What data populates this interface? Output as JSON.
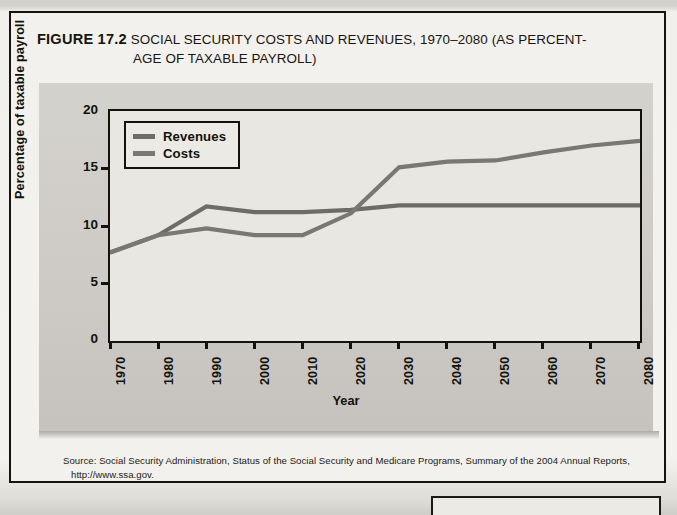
{
  "figure": {
    "number_label": "FIGURE 17.2",
    "title_line1": "SOCIAL SECURITY COSTS AND REVENUES, 1970–2080 (AS PERCENT-",
    "title_line2": "AGE OF TAXABLE PAYROLL)"
  },
  "source": {
    "line1": "Source: Social Security Administration, Status of the Social Security and Medicare Programs, Summary of the 2004 Annual Reports,",
    "line2": "http://www.ssa.gov.",
    "label": "Source:"
  },
  "chart_data": {
    "type": "line",
    "xlabel": "Year",
    "ylabel": "Percentage of taxable payroll",
    "xlim": [
      1970,
      2080
    ],
    "ylim": [
      0,
      20
    ],
    "yticks": [
      0,
      5,
      10,
      15,
      20
    ],
    "ytick_labels": [
      "0",
      "5",
      "10",
      "15",
      "20"
    ],
    "xticks": [
      1970,
      1980,
      1990,
      2000,
      2010,
      2020,
      2030,
      2040,
      2050,
      2060,
      2070,
      2080
    ],
    "xtick_labels": [
      "1970",
      "1980",
      "1990",
      "2000",
      "2010",
      "2020",
      "2030",
      "2040",
      "2050",
      "2060",
      "2070",
      "2080"
    ],
    "grid": false,
    "legend_position": "top-left",
    "x": [
      1970,
      1980,
      1990,
      2000,
      2010,
      2020,
      2030,
      2040,
      2050,
      2060,
      2070,
      2080
    ],
    "series": [
      {
        "name": "Revenues",
        "color": "#6e6c68",
        "values": [
          7.7,
          9.2,
          11.7,
          11.2,
          11.2,
          11.4,
          11.8,
          11.8,
          11.8,
          11.8,
          11.8,
          11.8
        ]
      },
      {
        "name": "Costs",
        "color": "#7a7874",
        "values": [
          7.7,
          9.2,
          9.8,
          9.2,
          9.2,
          11.1,
          15.1,
          15.6,
          15.7,
          16.4,
          17.0,
          17.4
        ]
      }
    ],
    "annotations": [
      {
        "text": "Costs cross above Revenues",
        "year": 2017,
        "value": 11.1
      }
    ]
  },
  "legend": {
    "items": [
      {
        "label": "Revenues"
      },
      {
        "label": "Costs"
      }
    ]
  }
}
